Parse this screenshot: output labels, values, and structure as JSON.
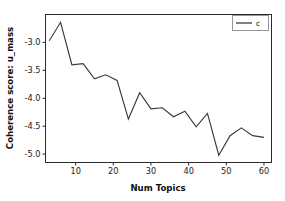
{
  "chart_data": {
    "type": "line",
    "title": "",
    "xlabel": "Num Topics",
    "ylabel": "Coherence score: u_mass",
    "xlim": [
      2,
      62
    ],
    "ylim": [
      -5.15,
      -2.5
    ],
    "grid": false,
    "legend_position": "upper right",
    "xticks": [
      10,
      20,
      30,
      40,
      50,
      60
    ],
    "xtick_labels": [
      "10",
      "20",
      "30",
      "40",
      "50",
      "60"
    ],
    "yticks": [
      -3.0,
      -3.5,
      -4.0,
      -4.5,
      -5.0
    ],
    "ytick_labels": [
      "-3.0",
      "-3.5",
      "-4.0",
      "-4.5",
      "-5.0"
    ],
    "series": [
      {
        "name": "c",
        "color": "#3a3a3a",
        "x": [
          3,
          6,
          9,
          12,
          15,
          18,
          21,
          24,
          27,
          30,
          33,
          36,
          39,
          42,
          45,
          48,
          51,
          54,
          57,
          60
        ],
        "values": [
          -2.97,
          -2.64,
          -3.4,
          -3.38,
          -3.65,
          -3.58,
          -3.68,
          -4.37,
          -3.9,
          -4.19,
          -4.17,
          -4.33,
          -4.23,
          -4.51,
          -4.27,
          -5.02,
          -4.67,
          -4.53,
          -4.67,
          -4.7
        ]
      }
    ]
  },
  "legend": {
    "entries": [
      {
        "label": "c"
      }
    ]
  },
  "axes": {
    "x_title": "Num Topics",
    "y_title": "Coherence score: u_mass"
  }
}
